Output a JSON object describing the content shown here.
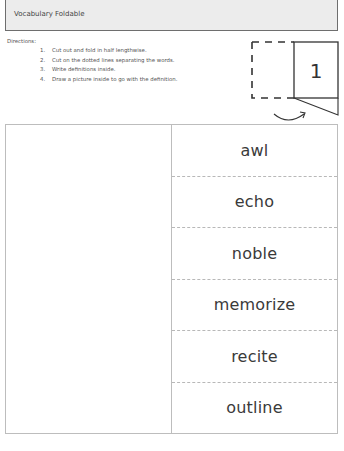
{
  "header": {
    "title": "Vocabulary Foldable"
  },
  "directions": {
    "label": "Directions:",
    "steps": [
      {
        "num": "1.",
        "text": "Cut out and fold in half lengthwise."
      },
      {
        "num": "2.",
        "text": "Cut on the dotted lines separating the words."
      },
      {
        "num": "3.",
        "text": "Write definitions inside."
      },
      {
        "num": "4.",
        "text": "Draw a picture inside to go with the definition."
      }
    ]
  },
  "diagram": {
    "panel_number": "1"
  },
  "foldable": {
    "words": [
      "awl",
      "echo",
      "noble",
      "memorize",
      "recite",
      "outline"
    ]
  },
  "colors": {
    "header_fill": "#ececec",
    "header_border": "#6e6e6e",
    "box_border": "#bdbdbd",
    "dash": "#b8b8b8",
    "text": "#3a3a3a"
  }
}
